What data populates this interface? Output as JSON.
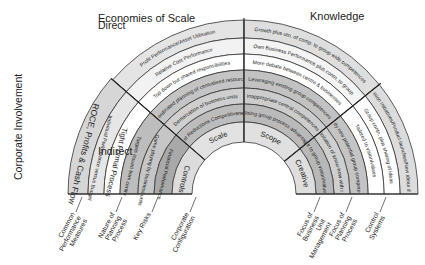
{
  "axis": {
    "vertical_title": "Corporate Involvement",
    "top_label": "Direct",
    "bottom_label": "Indirect"
  },
  "headers": {
    "economies_of_scale": "Economies of Scale",
    "knowledge": "Knowledge"
  },
  "left_block": {
    "rings": [
      {
        "text": "ROCE, Profits & Cash Flow",
        "fill": "#d6d6d6"
      },
      {
        "text": "Individual Performance versus Budget",
        "fill": "#e6e6e6"
      },
      {
        "text": "Tight Formal Process",
        "fill": "#ffffff"
      },
      {
        "text": "Targets issued from centre",
        "fill": "#bdbdbd"
      },
      {
        "text": "Game playing by business units",
        "fill": "#c6c6c6"
      },
      {
        "text": "Financial Performance",
        "fill": "#a9a9a9"
      },
      {
        "text": "Controls",
        "fill": "#dcdcdc"
      }
    ]
  },
  "scale_sector": {
    "rings": [
      {
        "text": "Profit Performance/Asset Utilisation",
        "fill": "#e4e4e4"
      },
      {
        "text": "Relative Cost Performance",
        "fill": "#f2f2f2"
      },
      {
        "text": "Top down but shared responsibilities",
        "fill": "#ffffff"
      },
      {
        "text": "Coordinated planning of centralised resources",
        "fill": "#c4c4c4"
      },
      {
        "text": "Demarcation of business units",
        "fill": "#cfcfcf"
      },
      {
        "text": "Cost Reductions Competitiveness",
        "fill": "#bcbcbc"
      },
      {
        "text": "Scale",
        "fill": "#e2e2e2"
      }
    ]
  },
  "scope_sector": {
    "rings": [
      {
        "text": "Growth plus utn. of comp. to group wide competences",
        "fill": "#dedede"
      },
      {
        "text": "Own Business Performance plus contn. to group",
        "fill": "#f4f4f4"
      },
      {
        "text": "More debate between centre & businesses",
        "fill": "#ffffff"
      },
      {
        "text": "Leveraging existing group competences",
        "fill": "#c2c2c2"
      },
      {
        "text": "Inappropriate central competences",
        "fill": "#cccccc"
      },
      {
        "text": "Utilising group process advantages",
        "fill": "#bababa"
      },
      {
        "text": "Scope",
        "fill": "#e0e0e0"
      }
    ]
  },
  "creative_sector": {
    "rings": [
      {
        "text": "Cross-division Initiatives/Product launches/New ideas developed",
        "fill": "#dcdcdc"
      },
      {
        "text": "Group contn. plus sharing of ideas",
        "fill": "#ffffff"
      },
      {
        "text": "Tailored to vision/values",
        "fill": "#ffffff"
      },
      {
        "text": "Identify new potential group competences",
        "fill": "#c4c4c4"
      },
      {
        "text": "No exploitation of know-how with in group",
        "fill": "#cfcfcf"
      },
      {
        "text": "Fit to group vision/values",
        "fill": "#b8b8b8"
      },
      {
        "text": "Creative",
        "fill": "#dedede"
      }
    ]
  },
  "footer_labels_left": [
    "Common Performance Measures",
    "Nature of Planning Process",
    "Key Risks",
    "Corporate Configuration"
  ],
  "footer_labels_right": [
    "Focus of Business Unit Management",
    "Focus of Planning Process",
    "Control Systems"
  ]
}
